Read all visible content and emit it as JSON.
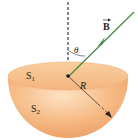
{
  "diagram": {
    "field_label": "B",
    "angle_label": "θ",
    "radius_label": "R",
    "surface_top_label": "S",
    "surface_top_sub": "1",
    "surface_bottom_label": "S",
    "surface_bottom_sub": "2",
    "colors": {
      "bowl_light": "#fbd3a8",
      "bowl_mid": "#f4b27a",
      "bowl_dark": "#e99a5a",
      "rim_top": "#f8c592",
      "field_line": "#3f8a3f",
      "dashed_line": "#444444",
      "radius_line": "#333333"
    }
  }
}
